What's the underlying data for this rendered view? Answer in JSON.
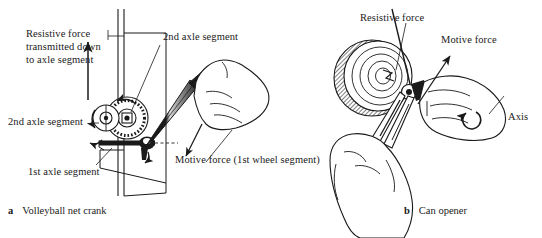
{
  "figure": {
    "background": "#ffffff",
    "ink": "#1a1a1a",
    "width": 542,
    "height": 238
  },
  "panel_a": {
    "caption_mark": "a",
    "caption_text": "Volleyball net crank",
    "labels": {
      "resistive_force": "Resistive force transmitted down to axle segment",
      "second_axle_top": "2nd axle segment",
      "second_axle_left": "2nd axle segment",
      "first_axle": "1st axle segment",
      "motive_force": "Motive force (1st wheel segment)"
    },
    "icons": {
      "post": "vertical-post",
      "gear": "gear-wheel",
      "crank": "crank-handle",
      "hand": "hand-gripping",
      "up_arrow": "resistive-force-arrow",
      "rotation": "rotation-arrow"
    }
  },
  "panel_b": {
    "caption_mark": "b",
    "caption_text": "Can opener",
    "labels": {
      "resistive_force": "Resistive force",
      "motive_force": "Motive force",
      "axis": "Axis"
    },
    "icons": {
      "can": "can-lid",
      "opener": "can-opener-body",
      "knob": "turn-knob",
      "hand_upper": "hand-turning-knob",
      "hand_lower": "hand-gripping-handle",
      "rotation": "axis-rotation-arrow",
      "motive_arrow": "motive-force-arrow"
    }
  }
}
